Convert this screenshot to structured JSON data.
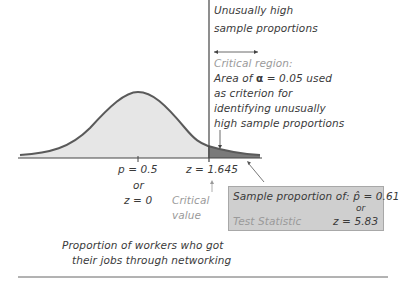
{
  "annotation_top": {
    "line1": "Unusually high",
    "line2": "sample proportions"
  },
  "critical_region": {
    "heading": "Critical region:",
    "line1_prefix": "Area of ",
    "alpha_symbol": "α",
    "line1_suffix": " = 0.05 used",
    "line2": "as criterion for",
    "line3": "identifying unusually",
    "line4": "high sample proportions"
  },
  "axis_labels": {
    "center_p": "p = 0.5",
    "center_or": "or",
    "center_z": "z = 0",
    "critical_z": "z = 1.645",
    "critical_label_1": "Critical",
    "critical_label_2": "value"
  },
  "result_box": {
    "line1_prefix": "Sample proportion of: ",
    "phat_symbol": "p̂",
    "line1_value": " = 0.61",
    "or": "or",
    "test_statistic_label": "Test Statistic",
    "test_statistic_value": "z = 5.83"
  },
  "x_axis_caption": {
    "line1": "Proportion of workers who got",
    "line2": "their jobs through networking"
  },
  "colors": {
    "curve": "#5a5a5a",
    "body_fill": "#e6e6e6",
    "critical_fill": "#7a7a7a",
    "box_fill": "#cfcfcf"
  }
}
